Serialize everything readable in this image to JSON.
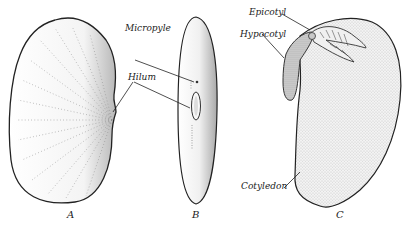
{
  "figure": {
    "panels": [
      {
        "id": "A",
        "caption": "A",
        "labels": [
          {
            "text": "Hilum"
          }
        ]
      },
      {
        "id": "B",
        "caption": "B",
        "labels": [
          {
            "text": "Micropyle"
          },
          {
            "text": "Hilum"
          }
        ]
      },
      {
        "id": "C",
        "caption": "C",
        "labels": [
          {
            "text": "Epicotyl"
          },
          {
            "text": "Hypocotyl"
          },
          {
            "text": "Cotyledon"
          }
        ]
      }
    ],
    "labels": {
      "micropyle": "Micropyle",
      "hilum": "Hilum",
      "epicotyl": "Epicotyl",
      "hypocotyl": "Hypocotyl",
      "cotyledon": "Cotyledon"
    },
    "captions": {
      "a": "A",
      "b": "B",
      "c": "C"
    },
    "colors": {
      "ink": "#222222",
      "shade": "#bdbdbd",
      "background": "#ffffff"
    }
  }
}
